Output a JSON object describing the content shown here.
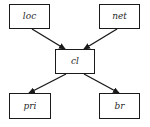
{
  "diagram": {
    "type": "directed-graph",
    "nodes": [
      {
        "id": "loc",
        "label": "loc",
        "x": 9,
        "y": 4,
        "w": 41,
        "h": 25
      },
      {
        "id": "net",
        "label": "net",
        "x": 99,
        "y": 4,
        "w": 41,
        "h": 25
      },
      {
        "id": "cl",
        "label": "cl",
        "x": 55,
        "y": 49,
        "w": 40,
        "h": 25
      },
      {
        "id": "pri",
        "label": "pri",
        "x": 9,
        "y": 93,
        "w": 42,
        "h": 26
      },
      {
        "id": "br",
        "label": "br",
        "x": 99,
        "y": 93,
        "w": 41,
        "h": 26
      }
    ],
    "edges": [
      {
        "from": "loc",
        "to": "cl"
      },
      {
        "from": "net",
        "to": "cl"
      },
      {
        "from": "cl",
        "to": "pri"
      },
      {
        "from": "cl",
        "to": "br"
      }
    ],
    "colors": {
      "stroke": "#1a1a1a",
      "background": "#ffffff",
      "text": "#2a2a2a"
    }
  }
}
